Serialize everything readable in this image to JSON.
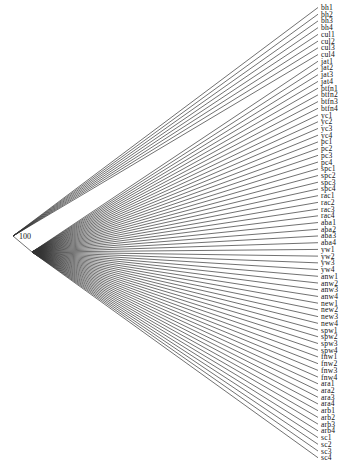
{
  "figure": {
    "type": "dendrogram",
    "root_support": "100",
    "root": {
      "x": 13,
      "y": 236
    },
    "inner_node": {
      "x": 32,
      "y": 252
    },
    "leaf_x": 318,
    "label_x": 321,
    "first_leaf_y": 7.5,
    "leaf_spacing": 6.72,
    "upper_clade_count": 8,
    "line_color": "#333333"
  },
  "leaves": [
    "bh1",
    "bh2",
    "bh3",
    "bh4",
    "cul1",
    "cul2",
    "cul3",
    "cul4",
    "jat1",
    "jat2",
    "jat3",
    "jat4",
    "btfn1",
    "btfn2",
    "btfn3",
    "btfn4",
    "yc1",
    "yc2",
    "yc3",
    "yc4",
    "pc1",
    "pc2",
    "pc3",
    "pc4",
    "spc1",
    "spc2",
    "spc3",
    "spc4",
    "rac1",
    "rac2",
    "rac3",
    "rac4",
    "aba1",
    "aba2",
    "aba3",
    "aba4",
    "yw1",
    "yw2",
    "yw3",
    "yw4",
    "anw1",
    "anw2",
    "anw3",
    "anw4",
    "new1",
    "new2",
    "new3",
    "new4",
    "spw1",
    "spw2",
    "spw3",
    "spw4",
    "fnw1",
    "fnw2",
    "fnw3",
    "fnw4",
    "ara1",
    "ara2",
    "ara3",
    "ara4",
    "arb1",
    "arb2",
    "arb3",
    "arb4",
    "sc1",
    "sc2",
    "sc3",
    "sc4"
  ]
}
